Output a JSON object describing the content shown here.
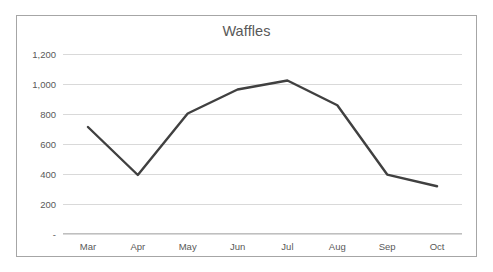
{
  "chart_data": {
    "type": "line",
    "title": "Waffles",
    "xlabel": "",
    "ylabel": "",
    "categories": [
      "Mar",
      "Apr",
      "May",
      "Jun",
      "Jul",
      "Aug",
      "Sep",
      "Oct"
    ],
    "values": [
      710,
      390,
      800,
      960,
      1020,
      855,
      393,
      315
    ],
    "series": [
      {
        "name": "Waffles",
        "values": [
          710,
          390,
          800,
          960,
          1020,
          855,
          393,
          315
        ]
      }
    ],
    "ylim": [
      0,
      1200
    ],
    "ytick_values": [
      0,
      200,
      400,
      600,
      800,
      1000,
      1200
    ],
    "ytick_labels": [
      "-",
      "200",
      "400",
      "600",
      "800",
      "1,000",
      "1,200"
    ],
    "grid": true,
    "grid_axis": "y",
    "legend": false,
    "legend_position": "none",
    "markers": false,
    "line_color": "#404040",
    "gridline_color": "#D9D9D9",
    "axis_color": "#BFBFBF",
    "text_color": "#595959",
    "border_color": "#A6A6A6",
    "background_color": "#FFFFFF"
  }
}
